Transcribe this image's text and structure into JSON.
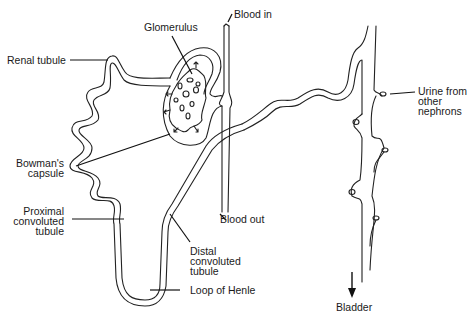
{
  "diagram": {
    "labels": {
      "glomerulus": "Glomerulus",
      "blood_in": "Blood in",
      "renal_tubule": "Renal tubule",
      "urine_from_other_nephrons": [
        "Urine from",
        "other",
        "nephrons"
      ],
      "bowmans_capsule": [
        "Bowman's",
        "capsule"
      ],
      "proximal_convoluted_tubule": [
        "Proximal",
        "convoluted",
        "tubule"
      ],
      "blood_out": "Blood out",
      "distal_convoluted_tubule": [
        "Distal",
        "convoluted",
        "tubule"
      ],
      "loop_of_henle": "Loop of Henle",
      "bladder": "Bladder"
    },
    "colors": {
      "line": "#222222",
      "text": "#1a1a1a",
      "background": "#ffffff"
    }
  }
}
